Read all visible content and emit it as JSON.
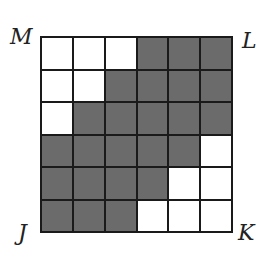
{
  "labels": {
    "top_left": "M",
    "top_right": "L",
    "bottom_left": "J",
    "bottom_right": "K"
  },
  "grid": {
    "rows": 6,
    "cols": 6,
    "shaded_color": "#6b6b6b",
    "unshaded_color": "#ffffff",
    "cells": [
      [
        0,
        0,
        0,
        1,
        1,
        1
      ],
      [
        0,
        0,
        1,
        1,
        1,
        1
      ],
      [
        0,
        1,
        1,
        1,
        1,
        1
      ],
      [
        1,
        1,
        1,
        1,
        1,
        0
      ],
      [
        1,
        1,
        1,
        1,
        0,
        0
      ],
      [
        1,
        1,
        1,
        0,
        0,
        0
      ]
    ]
  }
}
